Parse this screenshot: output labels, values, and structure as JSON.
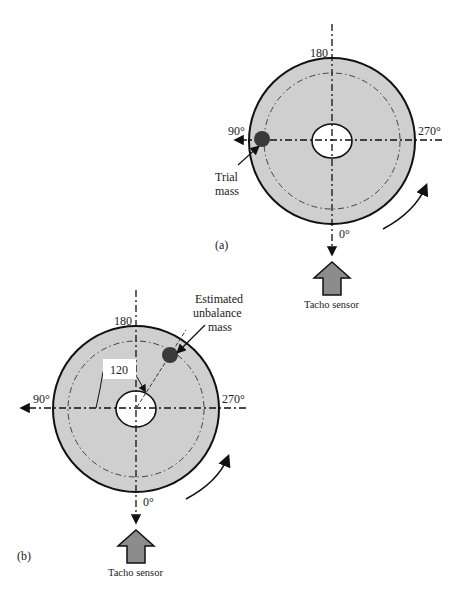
{
  "figure_a": {
    "panel_label": "(a)",
    "angles": {
      "top": "180",
      "left": "90°",
      "right": "270°",
      "bottom": "0°"
    },
    "mass_label_line1": "Trial",
    "mass_label_line2": "mass",
    "sensor_label": "Tacho sensor"
  },
  "figure_b": {
    "panel_label": "(b)",
    "angles": {
      "top": "180",
      "left": "90°",
      "right": "270°",
      "bottom": "0°"
    },
    "angle_value": "120",
    "mass_label_line1": "Estimated",
    "mass_label_line2": "unbalance",
    "mass_label_line3": "mass",
    "sensor_label": "Tacho sensor"
  },
  "colors": {
    "disc_fill": "#cfcfcf",
    "outline": "#111111",
    "mass": "#3a3a3a",
    "sensor_fill": "#8c8c8c"
  }
}
